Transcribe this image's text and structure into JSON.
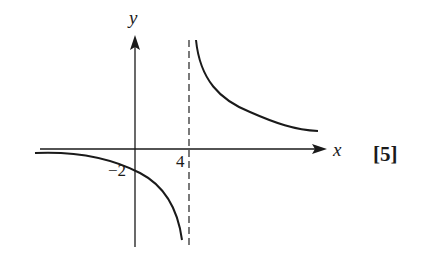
{
  "diagram": {
    "type": "function-sketch",
    "axes": {
      "x_label": "x",
      "y_label": "y"
    },
    "asymptotes": {
      "vertical": {
        "x": 4,
        "label": "4",
        "style": "dashed"
      },
      "horizontal": {
        "y": 0
      }
    },
    "intercepts": {
      "y_intercept": {
        "value": -2,
        "label": "−2"
      }
    },
    "branches": [
      {
        "name": "left-branch",
        "description": "below x-axis, approaches y=0 as x→-∞, descends to -∞ as x→4⁻"
      },
      {
        "name": "right-branch",
        "description": "above x-axis, descends from +∞ as x→4⁺, approaches y=0 as x→+∞"
      }
    ],
    "marks": "[5]"
  },
  "colors": {
    "ink": "#1a1a1a",
    "asymptote": "#333333",
    "background": "#ffffff"
  }
}
